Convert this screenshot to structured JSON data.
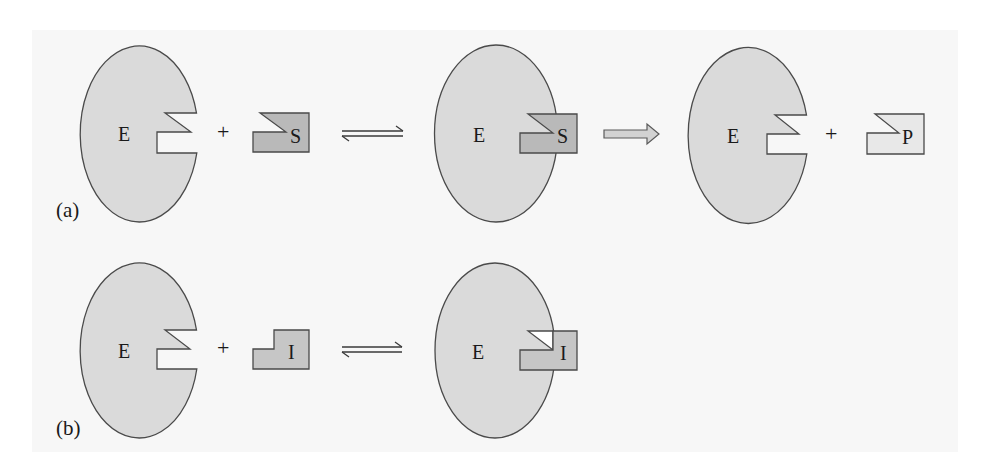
{
  "colors": {
    "background": "#ffffff",
    "panel": "#f7f7f7",
    "enzyme_fill": "#dadada",
    "substrate_fill": "#b9b9b9",
    "inhibitor_fill": "#c6c6c6",
    "product_fill": "#e8e8e8",
    "outline": "#4a4a4a",
    "arrow_fill": "#d2d2d2"
  },
  "panel_a": {
    "label": "(a)",
    "enzyme_label": "E",
    "plus": "+",
    "substrate_label": "S",
    "complex_enzyme_label": "E",
    "complex_substrate_label": "S",
    "product_enzyme_label": "E",
    "product_plus": "+",
    "product_label": "P",
    "equilibrium_icon": "equilibrium-arrows",
    "reaction_icon": "right-block-arrow"
  },
  "panel_b": {
    "label": "(b)",
    "enzyme_label": "E",
    "plus": "+",
    "inhibitor_label": "I",
    "complex_enzyme_label": "E",
    "complex_inhibitor_label": "I",
    "equilibrium_icon": "equilibrium-arrows"
  }
}
